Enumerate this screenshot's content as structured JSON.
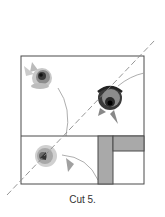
{
  "caption": "Cut 5.",
  "colors": {
    "outline": "#4a4a4a",
    "strip_fill": "#a9a9a9",
    "dashed_line": "#8a8a8a",
    "rose_dark": "#2a2a2a",
    "rose_mid": "#8c8c8c",
    "rose_light": "#c8c8c8"
  },
  "diagram": {
    "outer_square": {
      "x": 21,
      "y": 56,
      "w": 123,
      "h": 128
    },
    "divider_y": 136,
    "vertical_strip": {
      "x": 98,
      "y": 136,
      "w": 15,
      "h": 48
    },
    "top_right_rect": {
      "x": 113,
      "y": 136,
      "w": 31,
      "h": 15
    },
    "cut_line": {
      "x1": 7,
      "y1": 195,
      "x2": 155,
      "y2": 40,
      "style": "dashed"
    },
    "roses": [
      {
        "name": "rose-top-left",
        "cx": 41,
        "cy": 78
      },
      {
        "name": "rose-top-right",
        "cx": 109,
        "cy": 100
      },
      {
        "name": "rose-bottom-left",
        "cx": 44,
        "cy": 157
      }
    ]
  }
}
